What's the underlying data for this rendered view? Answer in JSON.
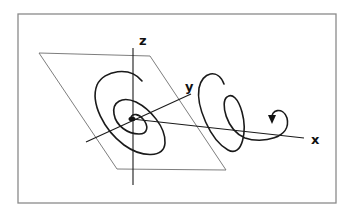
{
  "diagram": {
    "type": "3d-axes-spiral",
    "axes": {
      "x_label": "x",
      "y_label": "y",
      "z_label": "z"
    },
    "elements": [
      "frame border",
      "tilted plane (parallelogram)",
      "x axis",
      "y axis",
      "z axis",
      "planar spiral converging to origin",
      "helical trajectory along x axis with arrowhead"
    ],
    "colors": {
      "frame": "#8a8a8a",
      "plane": "#6e6e6e",
      "curve": "#1a1a1a"
    }
  }
}
